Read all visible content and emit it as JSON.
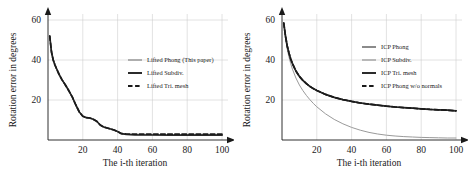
{
  "figure": {
    "panels": [
      {
        "id": "left-panel",
        "name": "lifted-methods-chart",
        "xlabel": "The i-th iteration",
        "ylabel": "Rotation error in degrees",
        "xticks": [
          "20",
          "40",
          "60",
          "80",
          "100"
        ],
        "yticks": [
          "20",
          "40",
          "60"
        ],
        "legend": [
          {
            "label": "Lifted Phong (This paper)",
            "color": "#8a8a8a",
            "style": "solid",
            "width": 1.0
          },
          {
            "label": "Lifted Subdiv.",
            "color": "#2b2b2b",
            "style": "solid",
            "width": 1.7
          },
          {
            "label": "Lifted Tri. mesh",
            "color": "#1a1a1a",
            "style": "dashed",
            "width": 1.7
          }
        ]
      },
      {
        "id": "right-panel",
        "name": "icp-methods-chart",
        "xlabel": "The i-th iteration",
        "ylabel": "Rotation error in degrees",
        "xticks": [
          "20",
          "40",
          "60",
          "80",
          "100"
        ],
        "yticks": [
          "20",
          "40",
          "60"
        ],
        "legend": [
          {
            "label": "ICP Phong",
            "color": "#6e6e6e",
            "style": "solid",
            "width": 1.3
          },
          {
            "label": "ICP Subdiv.",
            "color": "#9a9a9a",
            "style": "solid",
            "width": 1.0
          },
          {
            "label": "ICP Tri. mesh",
            "color": "#2b2b2b",
            "style": "solid",
            "width": 1.7
          },
          {
            "label": "ICP Phong w/o normals",
            "color": "#1a1a1a",
            "style": "dashed",
            "width": 1.7
          }
        ]
      }
    ]
  },
  "chart_data": [
    {
      "type": "line",
      "title": "",
      "xlabel": "The i-th iteration",
      "ylabel": "Rotation error in degrees",
      "xlim": [
        0,
        100
      ],
      "ylim": [
        0,
        60
      ],
      "xticks": [
        20,
        40,
        60,
        80,
        100
      ],
      "yticks": [
        20,
        40,
        60
      ],
      "grid": true,
      "legend_position": "center-right",
      "x": [
        1,
        2,
        3,
        4,
        5,
        6,
        7,
        8,
        10,
        12,
        14,
        16,
        18,
        20,
        22,
        24,
        26,
        28,
        30,
        32,
        34,
        36,
        38,
        40,
        42,
        45,
        50,
        55,
        60,
        70,
        80,
        90,
        100
      ],
      "series": [
        {
          "name": "Lifted Phong (This paper)",
          "values": [
            52.0,
            44.0,
            40.0,
            37.5,
            35.5,
            33.5,
            31.8,
            30.2,
            27.5,
            24.6,
            21.4,
            17.5,
            14.0,
            11.9,
            11.2,
            11.0,
            10.4,
            9.4,
            7.5,
            6.5,
            6.0,
            5.5,
            5.0,
            4.2,
            3.2,
            2.8,
            2.6,
            2.5,
            2.5,
            2.4,
            2.4,
            2.4,
            2.4
          ]
        },
        {
          "name": "Lifted Subdiv.",
          "values": [
            52.0,
            44.0,
            40.0,
            37.5,
            35.5,
            33.5,
            31.8,
            30.2,
            27.5,
            24.6,
            21.4,
            17.5,
            14.0,
            11.9,
            11.2,
            11.0,
            10.4,
            9.4,
            7.5,
            6.5,
            6.0,
            5.5,
            5.0,
            4.2,
            3.2,
            2.8,
            2.6,
            2.5,
            2.5,
            2.4,
            2.4,
            2.4,
            2.4
          ]
        },
        {
          "name": "Lifted Tri. mesh",
          "values": [
            52.0,
            44.0,
            40.0,
            37.5,
            35.5,
            33.5,
            31.8,
            30.2,
            27.5,
            24.6,
            21.4,
            17.5,
            14.0,
            11.9,
            11.2,
            11.0,
            10.4,
            9.4,
            7.5,
            6.5,
            6.0,
            5.5,
            5.0,
            4.2,
            3.3,
            3.0,
            2.9,
            2.9,
            2.9,
            2.9,
            2.9,
            2.9,
            2.9
          ]
        }
      ]
    },
    {
      "type": "line",
      "title": "",
      "xlabel": "The i-th iteration",
      "ylabel": "Rotation error in degrees",
      "xlim": [
        0,
        100
      ],
      "ylim": [
        0,
        60
      ],
      "xticks": [
        20,
        40,
        60,
        80,
        100
      ],
      "yticks": [
        20,
        40,
        60
      ],
      "grid": true,
      "legend_position": "center-right",
      "x": [
        1,
        2,
        3,
        4,
        5,
        6,
        8,
        10,
        12,
        14,
        16,
        18,
        20,
        25,
        30,
        35,
        40,
        45,
        50,
        55,
        60,
        65,
        70,
        75,
        80,
        85,
        90,
        95,
        100
      ],
      "series": [
        {
          "name": "ICP Phong",
          "values": [
            58.5,
            52.0,
            47.0,
            43.5,
            40.5,
            38.2,
            34.5,
            31.8,
            29.8,
            28.2,
            26.8,
            25.7,
            24.8,
            22.8,
            21.3,
            20.2,
            19.3,
            18.5,
            17.9,
            17.4,
            16.9,
            16.5,
            16.2,
            15.9,
            15.6,
            15.3,
            15.1,
            14.9,
            14.6
          ]
        },
        {
          "name": "ICP Subdiv.",
          "values": [
            58.5,
            51.0,
            45.5,
            41.5,
            38.2,
            35.4,
            31.0,
            27.5,
            24.7,
            22.3,
            20.2,
            18.3,
            16.6,
            13.1,
            10.3,
            8.1,
            6.3,
            4.9,
            3.8,
            3.0,
            2.4,
            2.0,
            1.7,
            1.5,
            1.3,
            1.2,
            1.1,
            1.0,
            1.0
          ]
        },
        {
          "name": "ICP Tri. mesh",
          "values": [
            58.5,
            52.0,
            47.0,
            43.5,
            40.5,
            38.2,
            34.5,
            31.8,
            29.8,
            28.2,
            26.8,
            25.7,
            24.8,
            22.8,
            21.3,
            20.2,
            19.3,
            18.5,
            17.9,
            17.4,
            16.9,
            16.5,
            16.2,
            15.9,
            15.6,
            15.3,
            15.1,
            14.9,
            14.6
          ]
        },
        {
          "name": "ICP Phong w/o normals",
          "values": [
            58.5,
            52.0,
            47.0,
            43.5,
            40.5,
            38.2,
            34.5,
            31.8,
            29.8,
            28.2,
            26.8,
            25.7,
            24.8,
            22.8,
            21.3,
            20.2,
            19.3,
            18.5,
            17.9,
            17.4,
            16.9,
            16.5,
            16.2,
            15.9,
            15.6,
            15.3,
            15.1,
            14.9,
            14.6
          ]
        }
      ]
    }
  ]
}
